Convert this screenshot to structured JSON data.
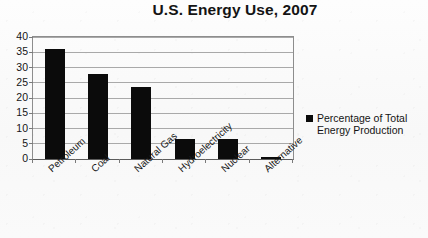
{
  "chart_data": {
    "type": "bar",
    "title": "U.S. Energy Use, 2007",
    "xlabel": "",
    "ylabel": "",
    "ylim": [
      0,
      40
    ],
    "ytick_step": 5,
    "yticks": [
      40,
      35,
      30,
      25,
      20,
      15,
      10,
      5,
      0
    ],
    "grid": true,
    "legend_position": "right",
    "categories": [
      "Petroleum",
      "Coal",
      "Natural Gas",
      "Hydroelectricity",
      "Nuclear",
      "Alternative"
    ],
    "values": [
      36,
      28,
      23.5,
      6.5,
      6.5,
      0.5
    ],
    "series": [
      {
        "name": "Percentage of Total Energy Production",
        "values": [
          36,
          28,
          23.5,
          6.5,
          6.5,
          0.5
        ],
        "color": "#0b0b0b"
      }
    ]
  },
  "legend": {
    "entries": [
      {
        "label": "Percentage of Total Energy Production",
        "color": "#0b0b0b"
      }
    ]
  },
  "colors": {
    "bar": "#0b0b0b",
    "gridline": "#a9a9a9",
    "axis": "#8d8d8d",
    "background": "#fbfbfb",
    "text": "#141414"
  }
}
